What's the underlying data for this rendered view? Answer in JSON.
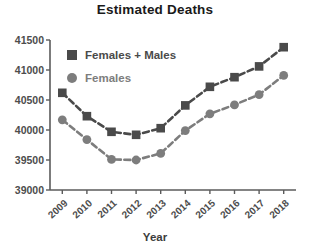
{
  "chart_data": {
    "type": "line",
    "title": "Estimated Deaths",
    "xlabel": "Year",
    "ylabel": "",
    "categories": [
      "2009",
      "2010",
      "2011",
      "2012",
      "2013",
      "2014",
      "2015",
      "2016",
      "2017",
      "2018"
    ],
    "ylim": [
      39000,
      41500
    ],
    "yticks": [
      39000,
      39500,
      40000,
      40500,
      41000,
      41500
    ],
    "ytick_labels": [
      "39000",
      "39500",
      "40000",
      "40500",
      "41000",
      "41500"
    ],
    "grid": false,
    "legend_position": "top-left-inside",
    "series": [
      {
        "name": "Females + Males",
        "marker": "square",
        "color": "#4a4a4a",
        "linestyle": "dashed",
        "values": [
          40620,
          40230,
          39970,
          39920,
          40030,
          40410,
          40720,
          40880,
          41060,
          41380
        ]
      },
      {
        "name": "Females",
        "marker": "circle",
        "color": "#7d7d7d",
        "linestyle": "dashed",
        "values": [
          40170,
          39840,
          39510,
          39500,
          39610,
          39990,
          40270,
          40420,
          40590,
          40910
        ]
      }
    ]
  },
  "legend": {
    "entries": [
      {
        "label": "Females + Males",
        "marker": "square-marker-icon",
        "color": "#4a4a4a"
      },
      {
        "label": "Females",
        "marker": "circle-marker-icon",
        "color": "#7d7d7d"
      }
    ]
  },
  "colors": {
    "axis": "#5b5b5b",
    "text": "#4d4d4d",
    "title": "#1a1a1a",
    "background": "#ffffff"
  }
}
